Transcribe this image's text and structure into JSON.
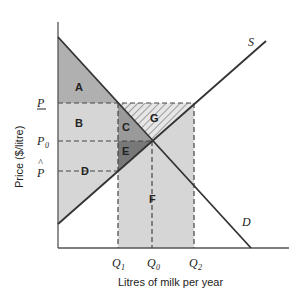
{
  "diagram": {
    "type": "supply-demand-price-floor",
    "axes": {
      "y_label": "Price ($/litre)",
      "x_label": "Litres of milk per year"
    },
    "price_ticks": {
      "p_floor": "P",
      "p_zero": "P",
      "p_zero_sub": "0",
      "p_hat": "P"
    },
    "quantity_ticks": {
      "q1": "Q",
      "q1_sub": "1",
      "q0": "Q",
      "q0_sub": "0",
      "q2": "Q",
      "q2_sub": "2"
    },
    "curves": {
      "supply": "S",
      "demand": "D"
    },
    "regions": {
      "a": "A",
      "b": "B",
      "c": "C",
      "d": "D",
      "e": "E",
      "f": "F",
      "g": "G"
    },
    "colors": {
      "light_fill": "#d6d6d6",
      "a_fill": "#b0b0b0",
      "c_fill": "#9a9a9a",
      "e_fill": "#787878",
      "line": "#3a3a3a"
    }
  }
}
